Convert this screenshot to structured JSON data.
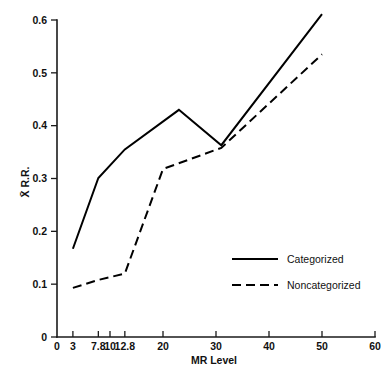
{
  "chart_data": {
    "type": "line",
    "title": "",
    "xlabel": "MR Level",
    "ylabel": "X̄ R.R.",
    "ylabel_plain": "X R.R.",
    "xlim": [
      0,
      60
    ],
    "ylim": [
      0,
      0.6
    ],
    "grid": false,
    "legend_position": "inside-lower-right",
    "x_ticks": [
      0,
      3,
      7.8,
      10,
      12.8,
      20,
      30,
      40,
      50,
      60
    ],
    "x_tick_labels": [
      "0",
      "3",
      "7.8",
      "10",
      "12.8",
      "20",
      "30",
      "40",
      "50",
      "60"
    ],
    "y_ticks": [
      0,
      0.1,
      0.2,
      0.3,
      0.4,
      0.5,
      0.6
    ],
    "y_tick_labels": [
      "0",
      "0.1",
      "0.2",
      "0.3",
      "0.4",
      "0.5",
      "0.6"
    ],
    "series": [
      {
        "name": "Categorized",
        "style": "solid",
        "color": "#000000",
        "x": [
          3,
          7.8,
          12.8,
          23,
          31,
          50
        ],
        "y": [
          0.167,
          0.301,
          0.355,
          0.43,
          0.363,
          0.611
        ]
      },
      {
        "name": "Noncategorized",
        "style": "dashed",
        "color": "#000000",
        "x": [
          3,
          7.8,
          12.8,
          20,
          31,
          50
        ],
        "y": [
          0.093,
          0.108,
          0.12,
          0.318,
          0.358,
          0.535
        ]
      }
    ]
  },
  "legend": {
    "items": [
      {
        "label": "Categorized",
        "style": "solid"
      },
      {
        "label": "Noncategorized",
        "style": "dashed"
      }
    ]
  },
  "axes": {
    "x_title": "MR Level",
    "y_title": "X̄ R.R."
  }
}
